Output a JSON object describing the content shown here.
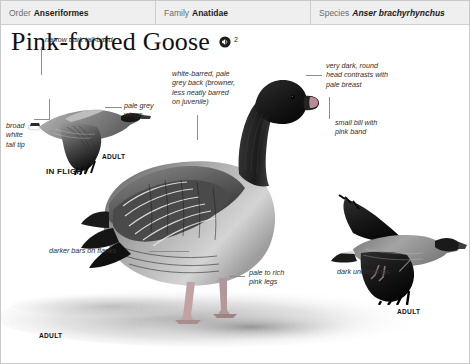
{
  "header": {
    "fields": [
      {
        "key": "Order",
        "value": "Anseriformes",
        "italic": false
      },
      {
        "key": "Family",
        "value": "Anatidae",
        "italic": false
      },
      {
        "key": "Species",
        "value": "Anser brachyrhynchus",
        "italic": true
      }
    ]
  },
  "title": {
    "text": "Pink-footed Goose",
    "audio_icon": "speaker-icon",
    "audio_count": "2"
  },
  "annotations": {
    "tail_band": "narrow dark tail-band",
    "broad_white": "broad\nwhite\ntail tip",
    "pale_grey": "pale grey\nwings",
    "white_barred": "white-barred, pale\ngrey back (browner,\nless neatly barred\non juvenile)",
    "dark_head": "very dark, round\nhead contrasts with\npale breast",
    "small_bill": "small bill with\npink band",
    "darker_bars": "darker bars on flanks",
    "pink_legs": "pale to rich\npink legs",
    "dark_underwings": "dark underwings"
  },
  "captions": {
    "adult_flight": "ADULT",
    "in_flight": "IN FLIGHT",
    "adult_standing": "ADULT",
    "adult_right": "ADULT"
  },
  "colors": {
    "header_bg": "#efefef",
    "header_key": "#6d6d6d",
    "header_value": "#1b1b1b",
    "annotation_text": "#2e2e2e",
    "leader_line": "#8d8d8d",
    "bird_dark": "#1d1d1d",
    "bird_mid": "#6a6a6a",
    "bird_light": "#c8c8c8",
    "ground": "#d8d8d8"
  }
}
